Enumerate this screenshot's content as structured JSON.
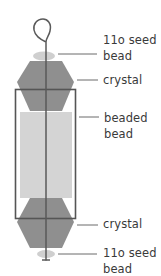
{
  "diagram": {
    "colors": {
      "wire": "#5a5a5a",
      "crystal": "#8f8f8f",
      "seed_bead": "#cfcfcf",
      "beaded_bead": "#d4d4d4",
      "frame": "#555555",
      "leader": "#6a6a6a",
      "text": "#3a3a3a"
    },
    "labels": [
      {
        "id": "top-seed-bead",
        "line1": "11o seed",
        "line2": "bead"
      },
      {
        "id": "top-crystal",
        "line1": "crystal"
      },
      {
        "id": "beaded-bead",
        "line1": "beaded",
        "line2": "bead"
      },
      {
        "id": "bottom-crystal",
        "line1": "crystal"
      },
      {
        "id": "bottom-seed-bead",
        "line1": "11o seed",
        "line2": "bead"
      }
    ]
  }
}
